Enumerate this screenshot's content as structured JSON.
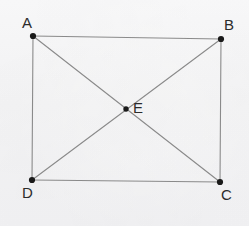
{
  "figure": {
    "shape_type": "rectangle-with-diagonals",
    "background_color": "#f6f6f7",
    "line_color": "#8a8a8a",
    "point_color": "#1a1a1a",
    "label_color": "#2b2b2b",
    "line_width": 1.1,
    "point_radius": 3,
    "canvas": {
      "width": 249,
      "height": 226
    },
    "points": [
      {
        "id": "A",
        "label": "A",
        "x": 33,
        "y": 36,
        "label_x": 22,
        "label_y": 15
      },
      {
        "id": "B",
        "label": "B",
        "x": 221,
        "y": 39,
        "label_x": 224,
        "label_y": 17
      },
      {
        "id": "C",
        "label": "C",
        "x": 220,
        "y": 182,
        "label_x": 221,
        "label_y": 187
      },
      {
        "id": "D",
        "label": "D",
        "x": 32,
        "y": 180,
        "label_x": 22,
        "label_y": 185
      },
      {
        "id": "E",
        "label": "E",
        "x": 126,
        "y": 109,
        "label_x": 133,
        "label_y": 100
      }
    ],
    "segments": [
      {
        "id": "AB",
        "from": "A",
        "to": "B",
        "kind": "side"
      },
      {
        "id": "BC",
        "from": "B",
        "to": "C",
        "kind": "side"
      },
      {
        "id": "CD",
        "from": "C",
        "to": "D",
        "kind": "side"
      },
      {
        "id": "DA",
        "from": "D",
        "to": "A",
        "kind": "side"
      },
      {
        "id": "AC",
        "from": "A",
        "to": "C",
        "kind": "diagonal"
      },
      {
        "id": "BD",
        "from": "B",
        "to": "D",
        "kind": "diagonal"
      }
    ]
  }
}
